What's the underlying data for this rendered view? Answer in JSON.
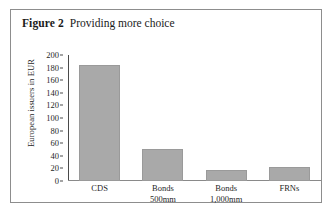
{
  "figure": {
    "number_label": "Figure 2",
    "caption": "Providing more choice"
  },
  "chart_data": {
    "type": "bar",
    "title": "Providing more choice",
    "xlabel": "",
    "ylabel": "European issuers in EUR",
    "categories": [
      "CDS",
      "Bonds 500mm",
      "Bonds 1,000mm",
      "FRNs"
    ],
    "category_lines": [
      {
        "line1": "CDS",
        "line2": ""
      },
      {
        "line1": "Bonds",
        "line2": "500mm"
      },
      {
        "line1": "Bonds",
        "line2": "1,000mm"
      },
      {
        "line1": "FRNs",
        "line2": ""
      }
    ],
    "values": [
      184,
      51,
      17,
      22
    ],
    "ylim": [
      0,
      200
    ],
    "ytick_values": [
      200,
      180,
      160,
      140,
      120,
      100,
      80,
      60,
      40,
      20,
      0
    ],
    "ytick_labels": [
      "200",
      "180",
      "160",
      "140",
      "120",
      "100",
      "80",
      "60",
      "40",
      "20",
      "0"
    ],
    "grid": false,
    "legend": "none",
    "bar_color": "#a9a9a9",
    "axis_color": "#4a4a4a"
  }
}
